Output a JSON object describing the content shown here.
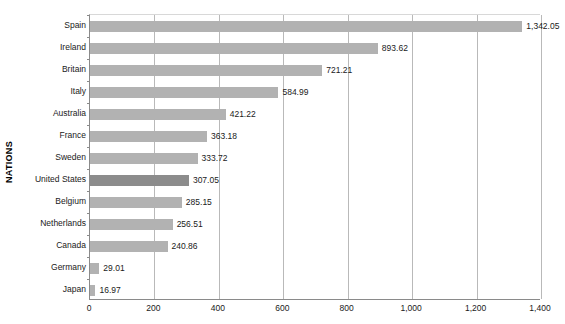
{
  "chart_data": {
    "type": "bar",
    "orientation": "horizontal",
    "title": "",
    "xlabel": "",
    "ylabel": "NATIONS",
    "categories": [
      "Spain",
      "Ireland",
      "Britain",
      "Italy",
      "Australia",
      "France",
      "Sweden",
      "United States",
      "Belgium",
      "Netherlands",
      "Canada",
      "Germany",
      "Japan"
    ],
    "values": [
      1342.05,
      893.62,
      721.21,
      584.99,
      421.22,
      363.18,
      333.72,
      307.05,
      285.15,
      256.51,
      240.86,
      29.01,
      16.97
    ],
    "value_labels": [
      "1,342.05",
      "893.62",
      "721.21",
      "584.99",
      "421.22",
      "363.18",
      "333.72",
      "307.05",
      "285.15",
      "256.51",
      "240.86",
      "29.01",
      "16.97"
    ],
    "highlight_category": "United States",
    "xlim": [
      0,
      1400
    ],
    "xticks": [
      0,
      200,
      400,
      600,
      800,
      1000,
      1200,
      1400
    ],
    "xtick_labels": [
      "0",
      "200",
      "400",
      "600",
      "800",
      "1,000",
      "1,200",
      "1,400"
    ],
    "grid": true,
    "legend": null,
    "bar_color": "#b2b2b2",
    "highlight_color": "#8c8c8c",
    "gridline_color": "#b9b9b9",
    "axis_color": "#8a8a8a",
    "background": "#ffffff"
  }
}
